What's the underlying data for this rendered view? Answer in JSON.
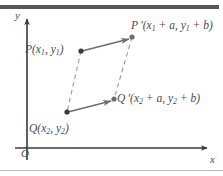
{
  "figure": {
    "kind": "coordinate-diagram",
    "colors": {
      "stroke": "#6e6e70",
      "dashed": "#9a9a9c",
      "axis": "#3a3a3c",
      "text": "#4a4a4c",
      "top_rule": "#58585a",
      "bottom_rule": "#b9b9bb",
      "background": "#ffffff"
    }
  },
  "axes": {
    "y_label": "y",
    "x_label": "x",
    "origin_label": "O"
  },
  "points": {
    "p": {
      "name": "P",
      "label_full": "P(x1, y1)",
      "prefix": "P(x",
      "sub1": "1",
      "mid": ", y",
      "sub2": "1",
      "suffix": ")",
      "cx": 81,
      "cy": 51
    },
    "q": {
      "name": "Q",
      "label_full": "Q(x2, y2)",
      "prefix": "Q(x",
      "sub1": "2",
      "mid": ", y",
      "sub2": "2",
      "suffix": ")",
      "cx": 67,
      "cy": 112
    },
    "p_prime": {
      "name": "P'",
      "label_full": "P'(x1 + a, y1 + b)",
      "prefix": "P '(x",
      "sub1": "1",
      "mid": " + a, y",
      "sub2": "1",
      "suffix": " + b)",
      "cx": 132,
      "cy": 37
    },
    "q_prime": {
      "name": "Q'",
      "label_full": "Q'(x2 + a, y2 + b)",
      "prefix": "Q '(x",
      "sub1": "2",
      "mid": " + a, y",
      "sub2": "2",
      "suffix": " + b)",
      "cx": 114,
      "cy": 99
    }
  },
  "segments": {
    "translation_p": {
      "style": "solid-arrow",
      "from": "P",
      "to": "P'"
    },
    "translation_q": {
      "style": "solid-arrow",
      "from": "Q",
      "to": "Q'"
    },
    "side_pq": {
      "style": "dashed",
      "from": "P",
      "to": "Q"
    },
    "side_pq_prime": {
      "style": "dashed",
      "from": "P'",
      "to": "Q'"
    }
  }
}
